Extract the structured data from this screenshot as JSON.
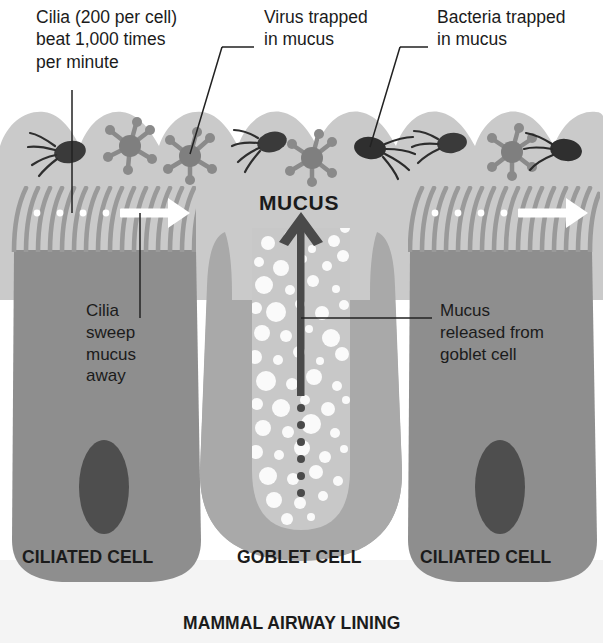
{
  "figure": {
    "bottom_caption": "MAMMAL AIRWAY LINING"
  },
  "colors": {
    "background": "#ffffff",
    "mucus_layer": "#c9c9c9",
    "lumen_gap": "#cccccc",
    "ciliated_cell": "#8e8e8e",
    "goblet_cell_outer": "#a8a8a8",
    "goblet_cell_inner": "#c6c6c6",
    "nucleus": "#4e4e4e",
    "cilia": "#9a9a9a",
    "granule": "#fbfbfb",
    "arrow_white": "#ffffff",
    "arrow_dark": "#4a4a4a",
    "microbe_dark": "#3a3a3a",
    "virus": "#8a8a8a",
    "leader_line": "#222222",
    "text": "#1b1b1b",
    "basement": "#f2f2f2"
  },
  "labels": {
    "cilia_count": {
      "text": "Cilia (200 per cell)\nbeat 1,000 times\nper minute",
      "lines": [
        "Cilia (200 per cell)",
        "beat 1,000 times",
        "per minute"
      ]
    },
    "virus_trapped": {
      "text": "Virus trapped\nin mucus",
      "lines": [
        "Virus trapped",
        "in mucus"
      ]
    },
    "bacteria_trapped": {
      "text": "Bacteria trapped\nin mucus",
      "lines": [
        "Bacteria trapped",
        "in mucus"
      ]
    },
    "cilia_sweep": {
      "text": "Cilia\nsweep\nmucus\naway",
      "lines": [
        "Cilia",
        "sweep",
        "mucus",
        "away"
      ]
    },
    "mucus_released": {
      "text": "Mucus\nreleased from\ngoblet cell",
      "lines": [
        "Mucus",
        "released from",
        "goblet cell"
      ]
    },
    "mucus_arrow": "MUCUS",
    "ciliated_cell_left": "CILIATED CELL",
    "goblet_cell": "GOBLET CELL",
    "ciliated_cell_right": "CILIATED CELL",
    "mammal_airway_lining": "MAMMAL AIRWAY LINING"
  },
  "annotations": {
    "cilia_count_numbers": {
      "cilia_per_cell": 200,
      "beats_per_minute": 1000
    },
    "cell_types": [
      "CILIATED CELL",
      "GOBLET CELL",
      "CILIATED CELL"
    ],
    "microbes": [
      "bacterium",
      "virus"
    ],
    "sweep_direction": "left-to-right",
    "mucus_direction": "upward"
  }
}
